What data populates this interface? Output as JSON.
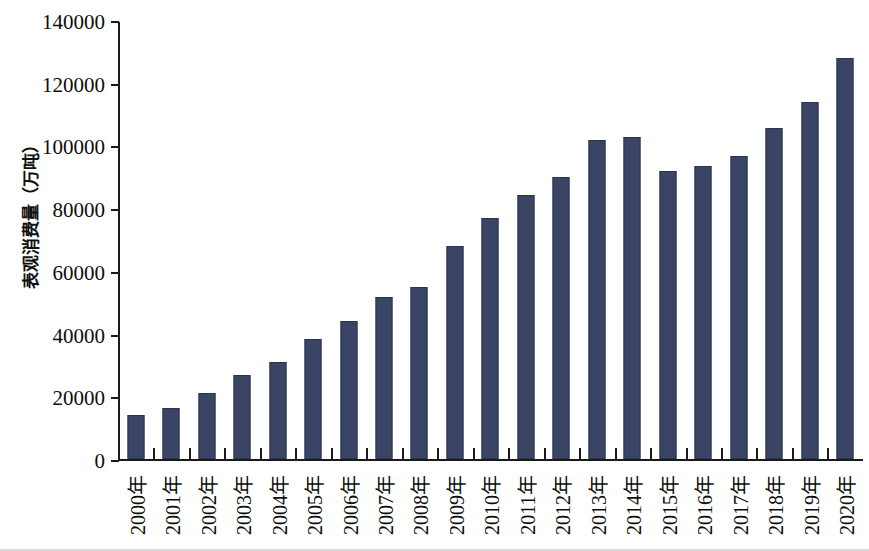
{
  "chart_data": {
    "type": "bar",
    "title": "",
    "xlabel": "",
    "ylabel": "表观消费量（万吨）",
    "ylim": [
      0,
      140000
    ],
    "ytick_values": [
      0,
      20000,
      40000,
      60000,
      80000,
      100000,
      120000,
      140000
    ],
    "ytick_labels": [
      "0",
      "20000",
      "40000",
      "60000",
      "80000",
      "100000",
      "120000",
      "140000"
    ],
    "grid": false,
    "legend": null,
    "bar_color": "#3a4565",
    "axis_color": "#1a1a1a",
    "categories": [
      "2000年",
      "2001年",
      "2002年",
      "2003年",
      "2004年",
      "2005年",
      "2006年",
      "2007年",
      "2008年",
      "2009年",
      "2010年",
      "2011年",
      "2012年",
      "2013年",
      "2014年",
      "2015年",
      "2016年",
      "2017年",
      "2018年",
      "2019年",
      "2020年"
    ],
    "values": [
      14000,
      16500,
      21000,
      26800,
      31000,
      38300,
      44300,
      52000,
      55200,
      68200,
      77200,
      84500,
      90500,
      102300,
      103300,
      92200,
      94000,
      97000,
      106200,
      114500,
      128500
    ],
    "series": [
      {
        "name": "表观消费量",
        "values": [
          14000,
          16500,
          21000,
          26800,
          31000,
          38300,
          44300,
          52000,
          55200,
          68200,
          77200,
          84500,
          90500,
          102300,
          103300,
          92200,
          94000,
          97000,
          106200,
          114500,
          128500
        ]
      }
    ]
  }
}
